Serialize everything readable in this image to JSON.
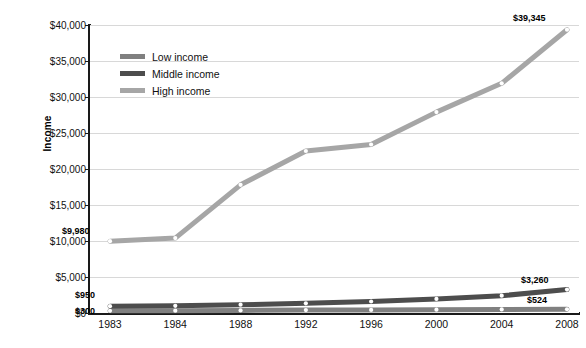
{
  "chart_data": {
    "type": "line",
    "title": "",
    "subtitle": "",
    "xlabel": "",
    "ylabel": "Income",
    "categories": [
      "1983",
      "1984",
      "1988",
      "1992",
      "1996",
      "2000",
      "2004",
      "2008"
    ],
    "ylim": [
      0,
      40000
    ],
    "ytick_values": [
      0,
      5000,
      10000,
      15000,
      20000,
      25000,
      30000,
      35000,
      40000
    ],
    "ytick_labels": [
      "$0",
      "$5,000",
      "$10,000",
      "$15,000",
      "$20,000",
      "$25,000",
      "$30,000",
      "$35,000",
      "$40,000"
    ],
    "grid": true,
    "legend_position": "upper-left-inside",
    "series": [
      {
        "name": "Low income",
        "color": "#808080",
        "values": [
          300,
          320,
          360,
          400,
          430,
          460,
          495,
          524
        ]
      },
      {
        "name": "Middle income",
        "color": "#4d4d4d",
        "values": [
          950,
          1000,
          1150,
          1350,
          1600,
          1950,
          2400,
          3260
        ]
      },
      {
        "name": "High income",
        "color": "#a6a6a6",
        "values": [
          9980,
          10400,
          17800,
          22500,
          23400,
          27900,
          31900,
          39345
        ]
      }
    ],
    "annotations": [
      {
        "text": "$9,980",
        "series": "High income",
        "category": "1983"
      },
      {
        "text": "$39,345",
        "series": "High income",
        "category": "2008"
      },
      {
        "text": "$950",
        "series": "Middle income",
        "category": "1983"
      },
      {
        "text": "$3,260",
        "series": "Middle income",
        "category": "2008"
      },
      {
        "text": "$300",
        "series": "Low income",
        "category": "1983"
      },
      {
        "text": "$524",
        "series": "Low income",
        "category": "2008"
      }
    ]
  },
  "legend": {
    "items": [
      {
        "label": "Low income",
        "color": "#808080"
      },
      {
        "label": "Middle income",
        "color": "#4d4d4d"
      },
      {
        "label": "High income",
        "color": "#a6a6a6"
      }
    ]
  },
  "colors": {
    "background": "#ffffff",
    "axis": "#1a1a1a",
    "gridline": "#d8d8d8",
    "text": "#111111",
    "low_income": "#808080",
    "middle_income": "#4d4d4d",
    "high_income": "#a6a6a6"
  }
}
